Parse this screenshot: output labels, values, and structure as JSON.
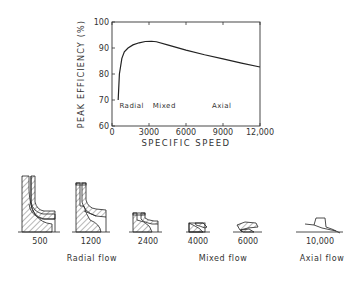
{
  "chart_data": {
    "type": "line",
    "title": "",
    "xlabel": "SPECIFIC SPEED",
    "ylabel": "PEAK EFFICIENCY (%)",
    "xlim": [
      0,
      12000
    ],
    "ylim": [
      60,
      100
    ],
    "x_ticks": [
      "0",
      "3000",
      "6000",
      "9000",
      "12,000"
    ],
    "x_tick_values": [
      0,
      3000,
      6000,
      9000,
      12000
    ],
    "y_ticks": [
      "60",
      "70",
      "80",
      "90",
      "100"
    ],
    "y_tick_values": [
      60,
      70,
      80,
      90,
      100
    ],
    "grid": false,
    "series": [
      {
        "name": "Peak efficiency",
        "x": [
          500,
          600,
          800,
          1000,
          1300,
          1700,
          2200,
          2700,
          3200,
          3600,
          4500,
          6000,
          7500,
          9000,
          10500,
          12000
        ],
        "y": [
          70,
          80,
          86,
          88.5,
          90,
          91.2,
          92,
          92.5,
          92.6,
          92.4,
          91.2,
          89.2,
          87.4,
          85.8,
          84.2,
          82.7
        ]
      }
    ],
    "annotations": [
      {
        "text": "Radial",
        "x": 600,
        "y": 68
      },
      {
        "text": "Mixed",
        "x": 3300,
        "y": 68
      },
      {
        "text": "Axial",
        "x": 8100,
        "y": 68
      }
    ]
  },
  "impellers": [
    {
      "label": "500",
      "kind": "radial"
    },
    {
      "label": "1200",
      "kind": "radial"
    },
    {
      "label": "2400",
      "kind": "radial"
    },
    {
      "label": "4000",
      "kind": "mixed"
    },
    {
      "label": "6000",
      "kind": "mixed"
    },
    {
      "label": "10,000",
      "kind": "axial"
    }
  ],
  "groups": {
    "radial": "Radial flow",
    "mixed": "Mixed flow",
    "axial": "Axial flow"
  }
}
